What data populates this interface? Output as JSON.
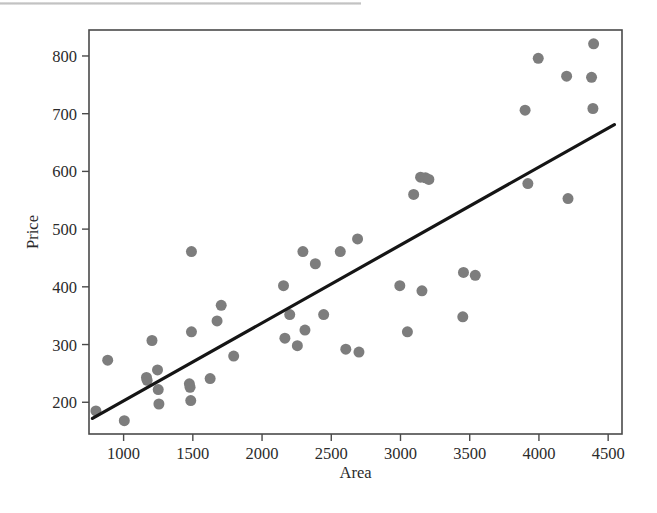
{
  "figure": {
    "background_color": "#ffffff",
    "plot_frame_color": "#4a4a4a",
    "point_color": "#7d7d7d",
    "line_color": "#151515",
    "scan_artifact": "gray-scan-band"
  },
  "chart_data": {
    "type": "scatter",
    "title": "",
    "subtitle": "",
    "xlabel": "Area",
    "ylabel": "Price",
    "xlim": [
      750,
      4600
    ],
    "ylim": [
      145,
      845
    ],
    "xticks": [
      1000,
      1500,
      2000,
      2500,
      3000,
      3500,
      4000,
      4500
    ],
    "xticklabels": [
      "1000",
      "1500",
      "2000",
      "2500",
      "3000",
      "3500",
      "4000",
      "4500"
    ],
    "yticks": [
      200,
      300,
      400,
      500,
      600,
      700,
      800
    ],
    "yticklabels": [
      "200",
      "300",
      "400",
      "500",
      "600",
      "700",
      "800"
    ],
    "grid": false,
    "legend": null,
    "legend_position": "none",
    "marker": "filled-circle",
    "marker_size": 11,
    "points": [
      {
        "x": 800,
        "y": 185
      },
      {
        "x": 1005,
        "y": 168
      },
      {
        "x": 885,
        "y": 273
      },
      {
        "x": 1165,
        "y": 243
      },
      {
        "x": 1170,
        "y": 238
      },
      {
        "x": 1205,
        "y": 307
      },
      {
        "x": 1245,
        "y": 256
      },
      {
        "x": 1250,
        "y": 222
      },
      {
        "x": 1255,
        "y": 197
      },
      {
        "x": 1475,
        "y": 232
      },
      {
        "x": 1480,
        "y": 226
      },
      {
        "x": 1485,
        "y": 203
      },
      {
        "x": 1490,
        "y": 461
      },
      {
        "x": 1490,
        "y": 322
      },
      {
        "x": 1625,
        "y": 241
      },
      {
        "x": 1675,
        "y": 341
      },
      {
        "x": 1705,
        "y": 368
      },
      {
        "x": 1795,
        "y": 280
      },
      {
        "x": 2155,
        "y": 402
      },
      {
        "x": 2165,
        "y": 311
      },
      {
        "x": 2200,
        "y": 352
      },
      {
        "x": 2255,
        "y": 298
      },
      {
        "x": 2295,
        "y": 461
      },
      {
        "x": 2310,
        "y": 325
      },
      {
        "x": 2385,
        "y": 440
      },
      {
        "x": 2445,
        "y": 352
      },
      {
        "x": 2565,
        "y": 461
      },
      {
        "x": 2605,
        "y": 292
      },
      {
        "x": 2690,
        "y": 483
      },
      {
        "x": 2700,
        "y": 287
      },
      {
        "x": 2995,
        "y": 402
      },
      {
        "x": 3050,
        "y": 322
      },
      {
        "x": 3095,
        "y": 560
      },
      {
        "x": 3145,
        "y": 590
      },
      {
        "x": 3155,
        "y": 393
      },
      {
        "x": 3180,
        "y": 589
      },
      {
        "x": 3205,
        "y": 586
      },
      {
        "x": 3450,
        "y": 348
      },
      {
        "x": 3455,
        "y": 425
      },
      {
        "x": 3540,
        "y": 420
      },
      {
        "x": 3900,
        "y": 706
      },
      {
        "x": 3920,
        "y": 579
      },
      {
        "x": 3995,
        "y": 796
      },
      {
        "x": 4200,
        "y": 765
      },
      {
        "x": 4210,
        "y": 553
      },
      {
        "x": 4380,
        "y": 763
      },
      {
        "x": 4390,
        "y": 709
      },
      {
        "x": 4395,
        "y": 821
      }
    ],
    "fit_line": {
      "label": "least-squares regression line",
      "x_start": 775,
      "y_start": 172,
      "x_end": 4545,
      "y_end": 681
    }
  }
}
